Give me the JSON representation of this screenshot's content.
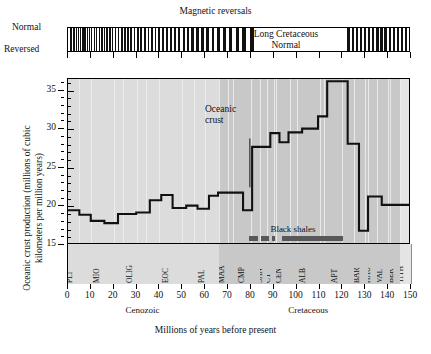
{
  "figure": {
    "magnetic_title": "Magnetic reversals",
    "polarity_labels": {
      "normal": "Normal",
      "reversed": "Reversed"
    },
    "long_normal_label": "Long Cretaceous\nNormal",
    "oceanic_crust_annotation": "Oceanic\ncrust",
    "black_shales_label": "Black shales",
    "y_axis_title": "Oceanic crust production (millions of cubic kilometers per million years)",
    "x_axis_title": "Millions of years before present",
    "era_labels": [
      {
        "name": "Cenozoic",
        "start": 0,
        "end": 66
      },
      {
        "name": "Cretaceous",
        "start": 66,
        "end": 145
      }
    ],
    "colors": {
      "cenozoic_band": "#dcdcdc",
      "cretaceous_band": "#c8c8c8",
      "tithonian_band": "#e4e4e4",
      "curve": "#111111",
      "shale_bar": "#585858",
      "gridline": "#efefef",
      "axis": "#000000"
    }
  },
  "chart_data": {
    "type": "line",
    "xlabel": "Millions of years before present",
    "ylabel": "Oceanic crust production (millions of cubic kilometers per million years)",
    "xlim": [
      0,
      150
    ],
    "ylim": [
      15,
      36.5
    ],
    "xticks": [
      0,
      10,
      20,
      30,
      40,
      50,
      60,
      70,
      80,
      90,
      100,
      110,
      120,
      130,
      140,
      150
    ],
    "yticks": [
      15,
      20,
      25,
      30,
      35
    ],
    "y_minor_ticks": [
      16,
      17,
      18,
      19,
      21,
      22,
      23,
      24,
      26,
      27,
      28,
      29,
      31,
      32,
      33,
      34,
      36
    ],
    "grid": "vertical-only",
    "legend": "none",
    "step_style": "post",
    "series": [
      {
        "name": "Oceanic crust production",
        "steps": [
          {
            "x_start": 0,
            "x_end": 5,
            "value": 19.3
          },
          {
            "x_start": 5,
            "x_end": 10,
            "value": 18.7
          },
          {
            "x_start": 10,
            "x_end": 16,
            "value": 17.9
          },
          {
            "x_start": 16,
            "x_end": 22,
            "value": 17.6
          },
          {
            "x_start": 22,
            "x_end": 30,
            "value": 18.8
          },
          {
            "x_start": 30,
            "x_end": 36,
            "value": 19.0
          },
          {
            "x_start": 36,
            "x_end": 41,
            "value": 20.6
          },
          {
            "x_start": 41,
            "x_end": 46,
            "value": 21.3
          },
          {
            "x_start": 46,
            "x_end": 52,
            "value": 19.6
          },
          {
            "x_start": 52,
            "x_end": 57,
            "value": 19.9
          },
          {
            "x_start": 57,
            "x_end": 62,
            "value": 19.5
          },
          {
            "x_start": 62,
            "x_end": 66,
            "value": 21.2
          },
          {
            "x_start": 66,
            "x_end": 72,
            "value": 21.6
          },
          {
            "x_start": 72,
            "x_end": 77,
            "value": 21.6
          },
          {
            "x_start": 77,
            "x_end": 81,
            "value": 19.3
          },
          {
            "x_start": 81,
            "x_end": 84,
            "value": 27.6
          },
          {
            "x_start": 84,
            "x_end": 89,
            "value": 27.6
          },
          {
            "x_start": 89,
            "x_end": 93,
            "value": 29.4
          },
          {
            "x_start": 93,
            "x_end": 97,
            "value": 28.2
          },
          {
            "x_start": 97,
            "x_end": 103,
            "value": 29.5
          },
          {
            "x_start": 103,
            "x_end": 110,
            "value": 30.0
          },
          {
            "x_start": 110,
            "x_end": 114,
            "value": 31.6
          },
          {
            "x_start": 114,
            "x_end": 118,
            "value": 36.2
          },
          {
            "x_start": 118,
            "x_end": 123,
            "value": 36.2
          },
          {
            "x_start": 123,
            "x_end": 128,
            "value": 28.0
          },
          {
            "x_start": 128,
            "x_end": 132,
            "value": 16.6
          },
          {
            "x_start": 132,
            "x_end": 138,
            "value": 21.1
          },
          {
            "x_start": 138,
            "x_end": 150,
            "value": 20.0
          }
        ]
      }
    ],
    "annotations": [
      {
        "text": "Oceanic crust",
        "x": 72,
        "y": 30.5,
        "points_to_x": 80,
        "points_to_y": 22.3
      },
      {
        "text": "Black shales",
        "x": 102,
        "y": 16.2
      }
    ],
    "black_shale_intervals": [
      {
        "start": 79.5,
        "end": 83.5
      },
      {
        "start": 85.0,
        "end": 88.5
      },
      {
        "start": 89.5,
        "end": 91.0
      },
      {
        "start": 94.0,
        "end": 120.5
      }
    ]
  },
  "stages": [
    {
      "abbr": "PLI",
      "start": 0,
      "end": 5,
      "era": "Cenozoic"
    },
    {
      "abbr": "MIO",
      "start": 5,
      "end": 24,
      "era": "Cenozoic"
    },
    {
      "abbr": "OLIG",
      "start": 24,
      "end": 34,
      "era": "Cenozoic"
    },
    {
      "abbr": "EOC",
      "start": 34,
      "end": 55,
      "era": "Cenozoic"
    },
    {
      "abbr": "PAL",
      "start": 55,
      "end": 66,
      "era": "Cenozoic"
    },
    {
      "abbr": "MAA",
      "start": 66,
      "end": 72,
      "era": "Cretaceous"
    },
    {
      "abbr": "CMP",
      "start": 72,
      "end": 84,
      "era": "Cretaceous"
    },
    {
      "abbr": "SAN",
      "start": 84,
      "end": 87,
      "era": "Cretaceous"
    },
    {
      "abbr": "CT",
      "start": 87,
      "end": 91,
      "era": "Cretaceous"
    },
    {
      "abbr": "CEN",
      "start": 91,
      "end": 97,
      "era": "Cretaceous"
    },
    {
      "abbr": "ALB",
      "start": 97,
      "end": 112,
      "era": "Cretaceous"
    },
    {
      "abbr": "APT",
      "start": 112,
      "end": 125,
      "era": "Cretaceous"
    },
    {
      "abbr": "BAR",
      "start": 125,
      "end": 131,
      "era": "Cretaceous"
    },
    {
      "abbr": "HAU",
      "start": 131,
      "end": 135,
      "era": "Cretaceous"
    },
    {
      "abbr": "VAL",
      "start": 135,
      "end": 141,
      "era": "Cretaceous"
    },
    {
      "abbr": "BER",
      "start": 141,
      "end": 145,
      "era": "Cretaceous"
    },
    {
      "abbr": "TITH",
      "start": 145,
      "end": 150,
      "era": "Jurassic"
    }
  ],
  "magnetic_reversals": {
    "long_normal": {
      "start": 84,
      "end": 121
    },
    "reversed_intervals": [
      {
        "s": 0.9,
        "e": 1.8
      },
      {
        "s": 2.4,
        "e": 3.0
      },
      {
        "s": 3.4,
        "e": 3.9
      },
      {
        "s": 4.3,
        "e": 4.9
      },
      {
        "s": 5.3,
        "e": 5.9
      },
      {
        "s": 6.3,
        "e": 6.8
      },
      {
        "s": 7.2,
        "e": 7.7
      },
      {
        "s": 8.1,
        "e": 8.7
      },
      {
        "s": 9.1,
        "e": 9.6
      },
      {
        "s": 10.1,
        "e": 10.7
      },
      {
        "s": 11.2,
        "e": 11.8
      },
      {
        "s": 12.3,
        "e": 12.9
      },
      {
        "s": 13.4,
        "e": 14.0
      },
      {
        "s": 14.5,
        "e": 15.1
      },
      {
        "s": 15.6,
        "e": 16.3
      },
      {
        "s": 16.8,
        "e": 17.4
      },
      {
        "s": 18.0,
        "e": 18.6
      },
      {
        "s": 19.2,
        "e": 19.9
      },
      {
        "s": 20.5,
        "e": 21.2
      },
      {
        "s": 21.8,
        "e": 22.5
      },
      {
        "s": 23.1,
        "e": 23.9
      },
      {
        "s": 24.5,
        "e": 25.2
      },
      {
        "s": 25.8,
        "e": 26.6
      },
      {
        "s": 27.2,
        "e": 28.0
      },
      {
        "s": 28.7,
        "e": 29.5
      },
      {
        "s": 30.2,
        "e": 31.0
      },
      {
        "s": 31.7,
        "e": 32.5
      },
      {
        "s": 33.2,
        "e": 34.0
      },
      {
        "s": 34.8,
        "e": 35.6
      },
      {
        "s": 36.3,
        "e": 37.1
      },
      {
        "s": 37.9,
        "e": 38.7
      },
      {
        "s": 39.5,
        "e": 40.4
      },
      {
        "s": 41.2,
        "e": 42.1
      },
      {
        "s": 42.9,
        "e": 43.8
      },
      {
        "s": 44.6,
        "e": 45.5
      },
      {
        "s": 46.4,
        "e": 47.3
      },
      {
        "s": 48.2,
        "e": 49.2
      },
      {
        "s": 50.1,
        "e": 51.1
      },
      {
        "s": 52.0,
        "e": 53.0
      },
      {
        "s": 54.0,
        "e": 55.1
      },
      {
        "s": 56.1,
        "e": 57.2
      },
      {
        "s": 58.3,
        "e": 59.4
      },
      {
        "s": 60.5,
        "e": 61.6
      },
      {
        "s": 62.8,
        "e": 64.0
      },
      {
        "s": 65.2,
        "e": 66.5
      },
      {
        "s": 67.8,
        "e": 69.1
      },
      {
        "s": 70.5,
        "e": 71.9
      },
      {
        "s": 73.3,
        "e": 74.8
      },
      {
        "s": 76.3,
        "e": 78.0
      },
      {
        "s": 79.6,
        "e": 81.4
      },
      {
        "s": 122.0,
        "e": 123.2
      },
      {
        "s": 124.0,
        "e": 125.0
      },
      {
        "s": 125.8,
        "e": 126.8
      },
      {
        "s": 127.6,
        "e": 128.6
      },
      {
        "s": 129.4,
        "e": 130.4
      },
      {
        "s": 131.2,
        "e": 132.2
      },
      {
        "s": 133.0,
        "e": 134.0
      },
      {
        "s": 134.8,
        "e": 135.8
      },
      {
        "s": 136.6,
        "e": 137.6
      },
      {
        "s": 138.4,
        "e": 139.4
      },
      {
        "s": 140.2,
        "e": 141.2
      },
      {
        "s": 142.0,
        "e": 143.0
      },
      {
        "s": 143.8,
        "e": 144.8
      },
      {
        "s": 145.6,
        "e": 146.6
      },
      {
        "s": 147.4,
        "e": 148.4
      },
      {
        "s": 149.0,
        "e": 150.0
      }
    ]
  }
}
